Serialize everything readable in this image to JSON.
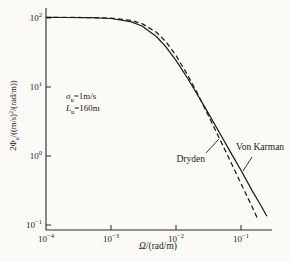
{
  "chart_data": {
    "type": "line",
    "scale": "log-log",
    "xlabel": {
      "sym": "Ω",
      "rest": "/(rad/m)"
    },
    "ylabel": {
      "pre": "2Φ",
      "sub": "u",
      "mid": "/((m/s)",
      "sup1": "2",
      "rest": "/(rad/m))"
    },
    "xlim": [
      0.0001,
      0.3
    ],
    "ylim": [
      0.1,
      150
    ],
    "grid": false,
    "x_ticks": [
      {
        "value": 0.0001,
        "base": "10",
        "exp": "−4"
      },
      {
        "value": 0.001,
        "base": "10",
        "exp": "−3"
      },
      {
        "value": 0.01,
        "base": "10",
        "exp": "−2"
      },
      {
        "value": 0.1,
        "base": "10",
        "exp": "−1"
      }
    ],
    "y_ticks": [
      {
        "value": 100,
        "base": "10",
        "exp": "2"
      },
      {
        "value": 10,
        "base": "10",
        "exp": "1"
      },
      {
        "value": 1,
        "base": "10",
        "exp": "0"
      },
      {
        "value": 0.1,
        "base": "10",
        "exp": "−1"
      }
    ],
    "series": [
      {
        "name": "Von Karman",
        "style": "solid",
        "points": [
          [
            0.0001,
            102
          ],
          [
            0.0002,
            101.8
          ],
          [
            0.0005,
            101.0
          ],
          [
            0.001,
            98.2
          ],
          [
            0.002,
            88.6
          ],
          [
            0.003,
            76.5
          ],
          [
            0.005,
            54.0
          ],
          [
            0.007,
            38.2
          ],
          [
            0.01,
            24.3
          ],
          [
            0.015,
            13.5
          ],
          [
            0.02,
            8.6
          ],
          [
            0.03,
            4.5
          ],
          [
            0.05,
            1.95
          ],
          [
            0.07,
            1.11
          ],
          [
            0.1,
            0.62
          ],
          [
            0.15,
            0.31
          ],
          [
            0.2,
            0.195
          ],
          [
            0.25,
            0.134
          ]
        ]
      },
      {
        "name": "Dryden",
        "style": "dashed",
        "points": [
          [
            0.0001,
            102
          ],
          [
            0.0002,
            101.9
          ],
          [
            0.0005,
            101.4
          ],
          [
            0.001,
            99.4
          ],
          [
            0.002,
            92.5
          ],
          [
            0.003,
            82.9
          ],
          [
            0.005,
            62.2
          ],
          [
            0.007,
            45.2
          ],
          [
            0.01,
            28.7
          ],
          [
            0.015,
            15.1
          ],
          [
            0.02,
            9.1
          ],
          [
            0.03,
            4.24
          ],
          [
            0.05,
            1.57
          ],
          [
            0.07,
            0.81
          ],
          [
            0.1,
            0.4
          ],
          [
            0.15,
            0.18
          ],
          [
            0.18,
            0.123
          ]
        ]
      }
    ],
    "annotations": {
      "params": {
        "line1": {
          "sym": "σ",
          "sub": "u",
          "rest": "=1m/s"
        },
        "line2": {
          "sym": "L",
          "sub": "u",
          "rest": "=160m"
        }
      }
    },
    "colors": {
      "line": "#1d1d1d",
      "background": "#fbfaf7",
      "text": "#1c1c1c"
    }
  }
}
